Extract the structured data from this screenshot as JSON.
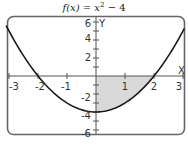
{
  "chart_data": {
    "type": "line",
    "title_parts": {
      "fx": "f(x)",
      "eq": " = ",
      "x": "x",
      "sup": "2",
      "rest": " − 4"
    },
    "xlabel": "X",
    "ylabel": "Y",
    "xlim": [
      -3.2,
      3.1
    ],
    "ylim": [
      -6.5,
      6.5
    ],
    "x_ticks": [
      -3,
      -2,
      -1,
      0,
      1,
      2,
      3
    ],
    "x_tick_labels": [
      "-3",
      "-2",
      "-1",
      "1",
      "2",
      "3"
    ],
    "y_ticks": [
      -6,
      -5,
      -4,
      -3,
      -2,
      -1,
      1,
      2,
      3,
      4,
      5,
      6
    ],
    "y_tick_labels": [
      "6",
      "4",
      "2",
      "-2",
      "-4",
      "-6"
    ],
    "grid": false,
    "series": [
      {
        "name": "f(x) = x^2 - 4",
        "function": "x^2 - 4",
        "x": [
          -3,
          -2,
          -1,
          0,
          1,
          2,
          3
        ],
        "values": [
          5,
          0,
          -3,
          -4,
          -3,
          0,
          5
        ]
      }
    ],
    "shaded_region": {
      "description": "Area between f(x) and x-axis from x=0 to x=2",
      "x_from": 0,
      "x_to": 2,
      "color": "#d9d9d9"
    },
    "colors": {
      "curve": "#1a1a1a",
      "axes": "#555555",
      "frame": "#666666",
      "shade": "#d9d9d9"
    }
  }
}
